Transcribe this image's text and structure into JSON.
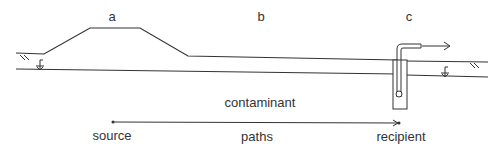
{
  "diagram": {
    "zone_labels": {
      "a": "a",
      "b": "b",
      "c": "c"
    },
    "contaminant_label": "contaminant",
    "path": {
      "start_label": "source",
      "middle_label": "paths",
      "end_label": "recipient"
    },
    "colors": {
      "line": "#333333",
      "background": "#ffffff"
    }
  }
}
